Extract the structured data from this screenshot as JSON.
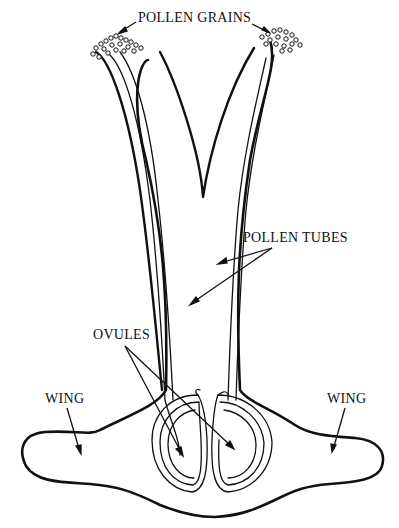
{
  "diagram": {
    "labels": {
      "pollen_grains": "POLLEN GRAINS",
      "pollen_tubes": "POLLEN TUBES",
      "ovules": "OVULES",
      "wing_left": "WING",
      "wing_right": "WING"
    },
    "colors": {
      "line": "#111111",
      "background": "#ffffff"
    }
  }
}
